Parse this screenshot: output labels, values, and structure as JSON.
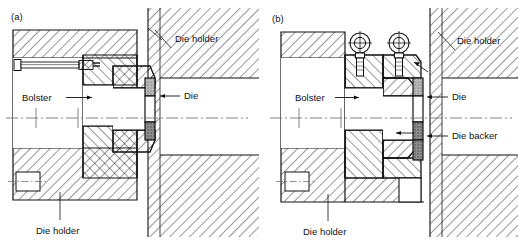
{
  "figure": {
    "type": "engineering-cross-section-drawing",
    "width": 518,
    "height": 245,
    "background": "#ffffff",
    "line_color": "#111111",
    "panels": [
      {
        "id": "a",
        "tag": "(a)",
        "callouts": [
          {
            "name": "die-holder-top",
            "text": "Die holder"
          },
          {
            "name": "die",
            "text": "Die"
          },
          {
            "name": "bolster",
            "text": "Bolster"
          },
          {
            "name": "die-holder-bottom",
            "text": "Die holder"
          }
        ]
      },
      {
        "id": "b",
        "tag": "(b)",
        "callouts": [
          {
            "name": "die-holder-top",
            "text": "Die holder"
          },
          {
            "name": "die",
            "text": "Die"
          },
          {
            "name": "die-backer",
            "text": "Die backer"
          },
          {
            "name": "bolster",
            "text": "Bolster"
          },
          {
            "name": "die-holder-bottom",
            "text": "Die holder"
          }
        ]
      }
    ],
    "colors": {
      "ink": "#111111",
      "hatch": "#1a1a1a",
      "die_fill_dark": "#8d8d8d",
      "die_fill_mid": "#b5b5b5",
      "bore_fill": "#ffffff",
      "centerline": "#777777"
    }
  },
  "panel_a": {
    "tag": "(a)",
    "label_die_holder_top": "Die holder",
    "label_die": "Die",
    "label_bolster": "Bolster",
    "label_die_holder_bottom": "Die holder"
  },
  "panel_b": {
    "tag": "(b)",
    "label_die_holder_top": "Die holder",
    "label_die": "Die",
    "label_die_backer": "Die backer",
    "label_bolster": "Bolster",
    "label_die_holder_bottom": "Die holder"
  }
}
